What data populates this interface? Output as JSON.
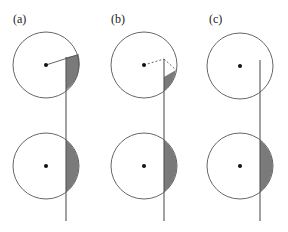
{
  "panels": [
    {
      "label": "(a)",
      "top_state": "radius line to rim, shaded segment right of vertical line",
      "bottom_state": "shaded segment right of vertical line"
    },
    {
      "label": "(b)",
      "top_state": "dashed radius to line top then dashed to rim, smaller shaded segment",
      "bottom_state": "shaded segment right of vertical line"
    },
    {
      "label": "(c)",
      "top_state": "vertical line inside circle, no shading",
      "bottom_state": "shaded segment right of vertical line"
    }
  ],
  "colors": {
    "stroke": "#555555",
    "fill_shade": "#7a7a7a",
    "dot": "#111111"
  }
}
